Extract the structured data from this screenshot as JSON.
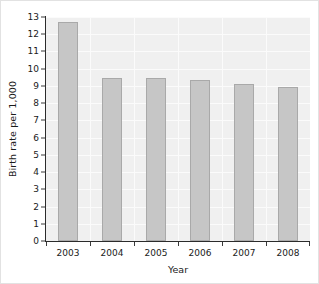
{
  "chart_data": {
    "type": "bar",
    "title": "",
    "xlabel": "Year",
    "ylabel": "Birth rate per 1,000",
    "categories": [
      "2003",
      "2004",
      "2005",
      "2006",
      "2007",
      "2008"
    ],
    "values": [
      12.7,
      9.45,
      9.45,
      9.35,
      9.1,
      8.95
    ],
    "series": [
      {
        "name": "Birth rate",
        "values": [
          12.7,
          9.45,
          9.45,
          9.35,
          9.1,
          8.95
        ]
      }
    ],
    "ylim": [
      0,
      13
    ],
    "ytick_labels": [
      "0",
      "1",
      "2",
      "3",
      "4",
      "5",
      "6",
      "7",
      "8",
      "9",
      "10",
      "11",
      "12",
      "13"
    ],
    "ytick_values": [
      0,
      1,
      2,
      3,
      4,
      5,
      6,
      7,
      8,
      9,
      10,
      11,
      12,
      13
    ],
    "grid": true,
    "legend": "none",
    "colors": {
      "bar_fill": "#c6c6c6",
      "bar_edge": "#a9a9a9",
      "plot_background": "#f0f0f0",
      "gridline": "#fbfbfb",
      "axis": "#2b2b2b",
      "text": "#1a1a1a",
      "figure_background": "#ffffff"
    }
  }
}
